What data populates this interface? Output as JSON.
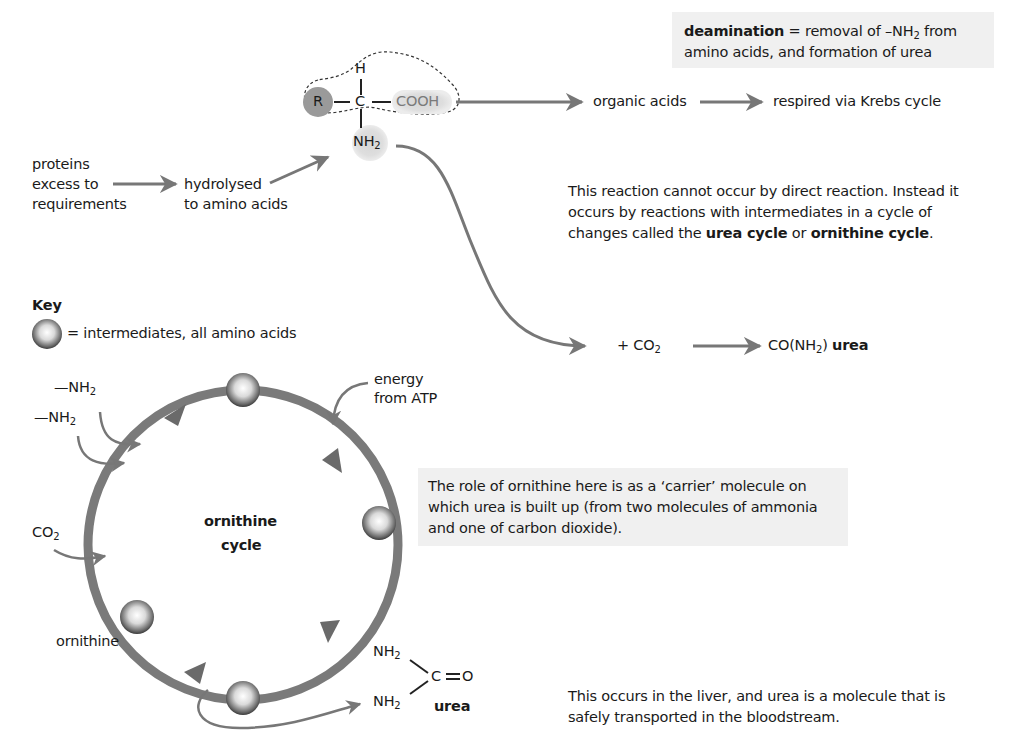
{
  "deamination_box": {
    "term": "deamination",
    "def_part1": " = removal of –NH",
    "sub": "2",
    "def_part2": " from",
    "line2": "amino acids, and formation of urea"
  },
  "amino_acid": {
    "r_group": "R",
    "carbon": "C",
    "hydrogen": "H",
    "carboxyl": "COOH",
    "amine": "NH",
    "amine_sub": "2"
  },
  "flow_top": {
    "organic_acids": "organic acids",
    "respired": "respired via Krebs cycle"
  },
  "proteins": {
    "line1": "proteins",
    "line2": "excess to",
    "line3": "requirements",
    "hydrolysed_line1": "hydrolysed",
    "hydrolysed_line2": "to amino acids"
  },
  "reaction_note": {
    "line1": "This reaction cannot occur by direct reaction. Instead it",
    "line2": "occurs by reactions with intermediates in a cycle of",
    "line3_a": "changes called the ",
    "line3_b": "urea cycle",
    "line3_c": " or ",
    "line3_d": "ornithine cycle",
    "line3_e": "."
  },
  "key": {
    "title": "Key",
    "label": "= intermediates, all amino acids"
  },
  "co2_reaction": {
    "plus_co2": "+ CO",
    "co2_sub": "2",
    "product": "CO(NH",
    "product_sub": "2",
    "product_end": ")",
    "urea": "urea"
  },
  "cycle": {
    "title_line1": "ornithine",
    "title_line2": "cycle",
    "nh2_a": "—NH",
    "nh2_b": "—NH",
    "nh2_sub": "2",
    "co2": "CO",
    "co2_sub": "2",
    "energy_line1": "energy",
    "energy_line2": "from ATP",
    "ornithine": "ornithine"
  },
  "carrier_note": {
    "line1": "The role of ornithine here is as a ‘carrier’ molecule on",
    "line2": "which urea is built up (from two molecules of ammonia",
    "line3": "and one of carbon dioxide)."
  },
  "urea_structure": {
    "nh2_top": "NH",
    "nh2_bottom": "NH",
    "sub": "2",
    "c": "C",
    "o": "O",
    "label": "urea"
  },
  "liver_note": {
    "line1": "This occurs in the liver, and urea is a molecule that is",
    "line2": "safely transported in the bloodstream."
  },
  "colors": {
    "arrow": "#777777",
    "box_bg": "#f0f0f0",
    "r_group": "#9a9a9a",
    "highlight": "#dcdcdc"
  }
}
